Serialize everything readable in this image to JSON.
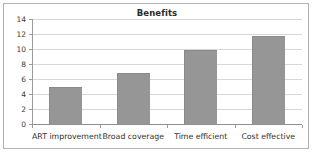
{
  "chart_data": {
    "type": "bar",
    "title": "Benefits",
    "xlabel": "",
    "ylabel": "",
    "categories": [
      "ART improvement",
      "Broad coverage",
      "Time efficient",
      "Cost effective"
    ],
    "values": [
      4.9,
      6.8,
      9.9,
      11.8
    ],
    "ylim": [
      0,
      14
    ],
    "yticks": [
      0,
      2,
      4,
      6,
      8,
      10,
      12,
      14
    ],
    "ytick_labels": [
      "0",
      "2",
      "4",
      "6",
      "8",
      "10",
      "12",
      "14"
    ],
    "grid": true,
    "gridlines": "horizontal",
    "legend": "none",
    "series": [
      {
        "name": "Benefits",
        "values": [
          4.9,
          6.8,
          9.9,
          11.8
        ],
        "color": "#969696"
      }
    ],
    "colors": {
      "bar_fill": "#969696",
      "bar_border": "#8a8a8a",
      "gridline": "#d6d6d6",
      "axis": "#9a9a9a",
      "frame_border": "#b2b2b2",
      "background": "#ffffff",
      "title_text": "#2b2b2b",
      "tick_text": "#3a3a3a"
    }
  }
}
